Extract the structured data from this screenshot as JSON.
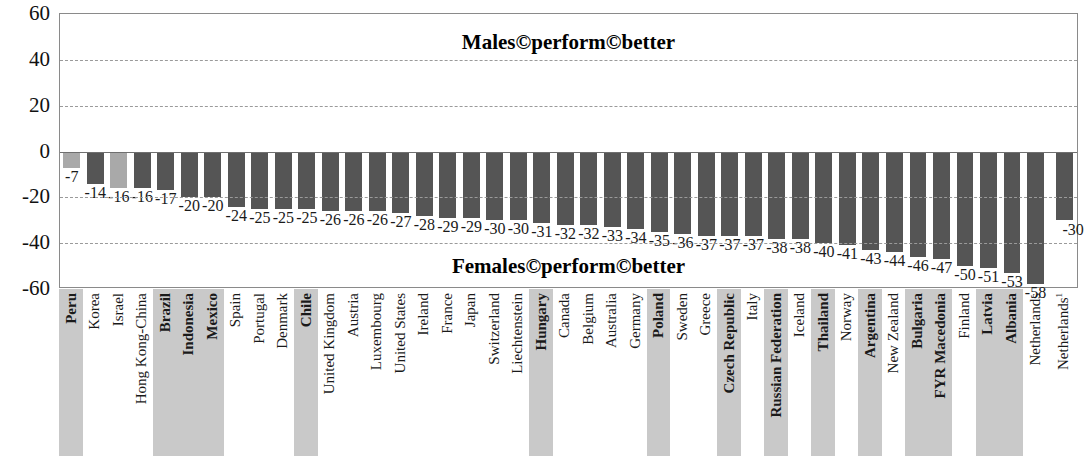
{
  "chart_data": {
    "type": "bar",
    "title": "",
    "xlabel": "",
    "ylabel": "",
    "ylim": [
      -60,
      60
    ],
    "yticks": [
      60,
      40,
      20,
      0,
      -20,
      -40,
      -60
    ],
    "grid": true,
    "legend": "none",
    "orientation": "vertical",
    "annotations": [
      {
        "text": "Males©perform©better",
        "position": "top-center"
      },
      {
        "text": "Females©perform©better",
        "position": "bottom-center"
      }
    ],
    "series_colors": {
      "oecd": "#555555",
      "partner": "#a9a9a9"
    },
    "categories": [
      "Peru",
      "Korea",
      "Israel",
      "Hong Kong-China",
      "Brazil",
      "Indonesia",
      "Mexico",
      "Spain",
      "Portugal",
      "Denmark",
      "Chile",
      "United Kingdom",
      "Austria",
      "Luxembourg",
      "United States",
      "Ireland",
      "France",
      "Japan",
      "Switzerland",
      "Liechtenstein",
      "Hungary",
      "Canada",
      "Belgium",
      "Australia",
      "Germany",
      "Poland",
      "Sweden",
      "Greece",
      "Czech Republic",
      "Italy",
      "Russian Federation",
      "Iceland",
      "Thailand",
      "Norway",
      "Argentina",
      "New Zealand",
      "Bulgaria",
      "FYR Macedonia",
      "Finland",
      "Latvia",
      "Albania",
      "Netherlands"
    ],
    "values": [
      -7,
      -14,
      -16,
      -16,
      -17,
      -20,
      -20,
      -24,
      -25,
      -25,
      -25,
      -26,
      -26,
      -26,
      -27,
      -28,
      -29,
      -29,
      -30,
      -30,
      -31,
      -32,
      -32,
      -33,
      -34,
      -35,
      -36,
      -37,
      -37,
      -37,
      -38,
      -38,
      -40,
      -41,
      -43,
      -44,
      -46,
      -47,
      -50,
      -51,
      -53,
      -58
    ],
    "last_bar_value": -30,
    "last_bar_label": "-30",
    "bar_shades": [
      "light",
      "dark",
      "light",
      "dark",
      "dark",
      "dark",
      "dark",
      "dark",
      "dark",
      "dark",
      "dark",
      "dark",
      "dark",
      "dark",
      "dark",
      "dark",
      "dark",
      "dark",
      "dark",
      "dark",
      "dark",
      "dark",
      "dark",
      "dark",
      "dark",
      "dark",
      "dark",
      "dark",
      "dark",
      "dark",
      "dark",
      "dark",
      "dark",
      "dark",
      "dark",
      "dark",
      "dark",
      "dark",
      "dark",
      "dark",
      "dark",
      "dark"
    ],
    "shaded_categories": [
      "Peru",
      "Brazil",
      "Indonesia",
      "Mexico",
      "Chile",
      "Hungary",
      "Poland",
      "Czech Republic",
      "Russian Federation",
      "Thailand",
      "Argentina",
      "Bulgaria",
      "FYR Macedonia",
      "Latvia",
      "Albania"
    ],
    "footnote_marker": "1",
    "footnote_category": "Netherlands"
  }
}
